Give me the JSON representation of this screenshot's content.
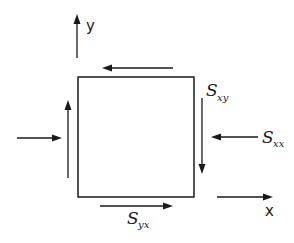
{
  "diagram": {
    "type": "stress-element",
    "axes": {
      "x_label": "x",
      "y_label": "y"
    },
    "labels": {
      "shear_xy": {
        "main": "S",
        "sub": "xy"
      },
      "normal_xx": {
        "main": "S",
        "sub": "xx"
      },
      "shear_yx": {
        "main": "S",
        "sub": "yx"
      }
    },
    "arrows": [
      {
        "id": "y-axis",
        "direction": "up"
      },
      {
        "id": "x-axis",
        "direction": "right"
      },
      {
        "id": "top-shear",
        "direction": "left"
      },
      {
        "id": "bottom-shear",
        "direction": "right"
      },
      {
        "id": "left-shear",
        "direction": "up"
      },
      {
        "id": "right-shear",
        "direction": "down"
      },
      {
        "id": "left-normal",
        "direction": "right"
      },
      {
        "id": "right-normal",
        "direction": "left"
      }
    ]
  }
}
